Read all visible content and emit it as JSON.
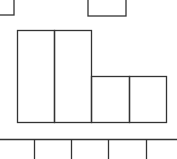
{
  "diagram": {
    "stroke_color": "#333333",
    "background": "#ffffff",
    "top_boxes": [
      {
        "id": "partial-box-left",
        "x": -2,
        "y": -2,
        "w": 16,
        "h": 17
      },
      {
        "id": "partial-box-right",
        "x": 88,
        "y": -2,
        "w": 38,
        "h": 18
      }
    ],
    "main_boxes": [
      {
        "id": "tall-box-1",
        "x": 17.5,
        "y": 30.5,
        "w": 37,
        "h": 92
      },
      {
        "id": "tall-box-2",
        "x": 54.5,
        "y": 30.5,
        "w": 37,
        "h": 92
      },
      {
        "id": "short-box-1",
        "x": 91.5,
        "y": 76.5,
        "w": 38,
        "h": 46
      },
      {
        "id": "short-box-2",
        "x": 129.5,
        "y": 76.5,
        "w": 37,
        "h": 46
      }
    ],
    "bottom_row": {
      "line_y": 139.5,
      "dividers_x": [
        34.5,
        71.5,
        108.5,
        146.5
      ]
    }
  }
}
